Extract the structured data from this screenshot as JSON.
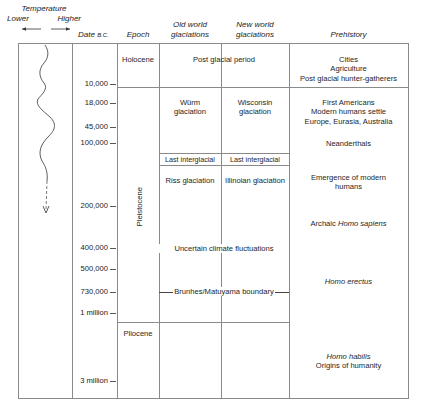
{
  "headers": {
    "temperature": "Temperature",
    "lower": "Lower",
    "higher": "Higher",
    "date": "Date",
    "date_suffix": "B.C.",
    "epoch": "Epoch",
    "old_world_1": "Old world",
    "old_world_2": "glaciations",
    "new_world_1": "New world",
    "new_world_2": "glaciations",
    "prehistory": "Prehistory"
  },
  "dates": [
    {
      "label": "10,000",
      "y": 84
    },
    {
      "label": "18,000",
      "y": 103
    },
    {
      "label": "45,000",
      "y": 127
    },
    {
      "label": "100,000",
      "y": 143
    },
    {
      "label": "200,000",
      "y": 206
    },
    {
      "label": "400,000",
      "y": 248
    },
    {
      "label": "500,000",
      "y": 269
    },
    {
      "label": "730,000",
      "y": 292
    },
    {
      "label": "1 million",
      "y": 313
    },
    {
      "label": "3 million",
      "y": 381
    }
  ],
  "epochs": {
    "holocene": "Holocene",
    "pleistocene": "Pleistocene",
    "pliocene": "Pliocene"
  },
  "glaciations": {
    "post_glacial": "Post glacial period",
    "wurm_1": "Würm",
    "wurm_2": "glaciation",
    "wisconsin_1": "Wisconsin",
    "wisconsin_2": "glaciation",
    "old_last_interglacial": "Last interglacial",
    "new_last_interglacial": "Last interglacial",
    "riss": "Riss glaciation",
    "illinoian": "Illinoian glaciation",
    "uncertain": "Uncertain climate fluctuations",
    "brunhes": "Brunhes/Matuyama boundary"
  },
  "prehistory": {
    "cities": "Cities",
    "agriculture": "Agriculture",
    "post_glacial_hg": "Post glacial hunter-gatherers",
    "first_americans": "First Americans",
    "modern_settle": "Modern humans settle",
    "europe": "Europe, Eurasia, Australia",
    "neanderthals": "Neanderthals",
    "emergence_1": "Emergence of modern",
    "emergence_2": "humans",
    "archaic_prefix": "Archaic ",
    "archaic_italic": "Homo sapiens",
    "homo_erectus": "Homo erectus",
    "homo_habilis": "Homo habilis",
    "origins": "Origins of humanity"
  },
  "colors": {
    "rule": "#8a8a8a",
    "text": "#1e1e1e",
    "curve": "#333333"
  }
}
